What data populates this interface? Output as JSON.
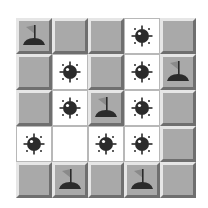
{
  "game": {
    "type": "minesweeper",
    "rows": 5,
    "cols": 5,
    "colors": {
      "covered": "#a9a9a9",
      "revealed": "#ffffff",
      "icon": "#2b2b2b",
      "flag_cloth": "#8a8a8a"
    },
    "grid": [
      [
        "flag",
        "covered",
        "covered",
        "mine",
        "covered"
      ],
      [
        "covered",
        "mine",
        "covered",
        "mine",
        "flag"
      ],
      [
        "covered",
        "mine",
        "flag",
        "mine",
        "covered"
      ],
      [
        "mine",
        "empty",
        "mine",
        "mine",
        "covered"
      ],
      [
        "covered",
        "flag",
        "covered",
        "flag",
        "covered"
      ]
    ]
  }
}
